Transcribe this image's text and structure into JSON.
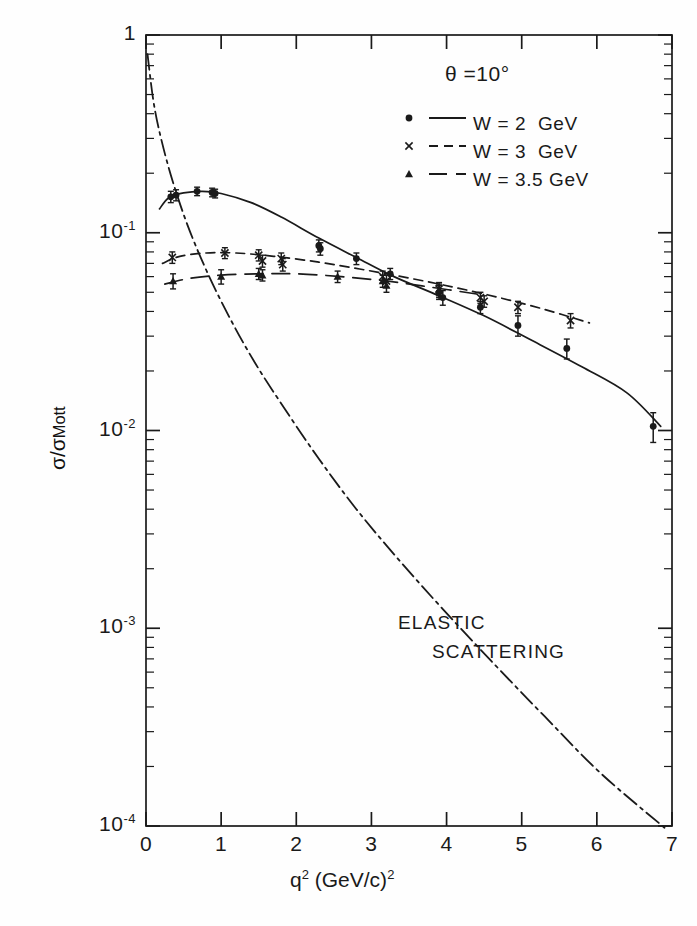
{
  "figure": {
    "annotation_theta": "θ =10°",
    "annotation_elastic_line1": "ELASTIC",
    "annotation_elastic_line2": "SCATTERING"
  },
  "axes": {
    "x": {
      "title_main": "q",
      "title_sup": "2",
      "title_unit": " (GeV/c)",
      "title_unit_sup": "2",
      "title_full": "q2 (GeV/c)2",
      "ticks": [
        "0",
        "1",
        "2",
        "3",
        "4",
        "5",
        "6",
        "7"
      ],
      "range": [
        0,
        7
      ]
    },
    "y": {
      "title_full": "σ/σ",
      "title_sub": "Mott",
      "ticks": [
        {
          "label": "1",
          "exp": "",
          "value": 1
        },
        {
          "label": "10",
          "exp": "-1",
          "value": 0.1
        },
        {
          "label": "10",
          "exp": "-2",
          "value": 0.01
        },
        {
          "label": "10",
          "exp": "-3",
          "value": 0.001
        },
        {
          "label": "10",
          "exp": "-4",
          "value": 0.0001
        }
      ],
      "range": [
        0.0001,
        1
      ],
      "scale": "log"
    }
  },
  "legend": {
    "position": "top-right",
    "entries": [
      {
        "marker": "dot",
        "line": "solid",
        "label": "W = 2  GeV"
      },
      {
        "marker": "cross",
        "line": "dashed",
        "label": "W = 3  GeV"
      },
      {
        "marker": "triangle",
        "line": "longdash",
        "label": "W = 3.5 GeV"
      }
    ]
  },
  "chart_data": {
    "type": "scatter",
    "title": "",
    "subtitle": "",
    "xlabel": "q2 (GeV/c)2",
    "ylabel": "sigma/sigma_Mott",
    "xlim": [
      0,
      7
    ],
    "ylim": [
      0.0001,
      1
    ],
    "yscale": "log",
    "grid": false,
    "legend_position": "top-right",
    "annotations": [
      {
        "text": "θ =10°",
        "x": 3.3,
        "y": 0.52
      },
      {
        "text": "ELASTIC SCATTERING",
        "x": 4.4,
        "y": 0.0014
      }
    ],
    "series": [
      {
        "name": "W = 2  GeV",
        "marker": "dot",
        "linestyle": "solid",
        "points": [
          {
            "x": 0.33,
            "y": 0.152,
            "yerr": 0.01
          },
          {
            "x": 0.4,
            "y": 0.155,
            "yerr": 0.01
          },
          {
            "x": 0.68,
            "y": 0.162,
            "yerr": 0.008
          },
          {
            "x": 0.88,
            "y": 0.16,
            "yerr": 0.008
          },
          {
            "x": 0.92,
            "y": 0.158,
            "yerr": 0.008
          },
          {
            "x": 2.3,
            "y": 0.086,
            "yerr": 0.006
          },
          {
            "x": 2.32,
            "y": 0.083,
            "yerr": 0.006
          },
          {
            "x": 2.8,
            "y": 0.074,
            "yerr": 0.005
          },
          {
            "x": 3.25,
            "y": 0.062,
            "yerr": 0.004
          },
          {
            "x": 3.9,
            "y": 0.05,
            "yerr": 0.004
          },
          {
            "x": 3.95,
            "y": 0.047,
            "yerr": 0.004
          },
          {
            "x": 4.45,
            "y": 0.042,
            "yerr": 0.003
          },
          {
            "x": 4.95,
            "y": 0.034,
            "yerr": 0.004
          },
          {
            "x": 5.6,
            "y": 0.026,
            "yerr": 0.003
          },
          {
            "x": 6.75,
            "y": 0.0105,
            "yerr": 0.0018
          }
        ],
        "curve": [
          {
            "x": 0.18,
            "y": 0.132
          },
          {
            "x": 0.3,
            "y": 0.15
          },
          {
            "x": 0.5,
            "y": 0.159
          },
          {
            "x": 0.75,
            "y": 0.162
          },
          {
            "x": 1.0,
            "y": 0.158
          },
          {
            "x": 1.4,
            "y": 0.142
          },
          {
            "x": 1.8,
            "y": 0.12
          },
          {
            "x": 2.3,
            "y": 0.094
          },
          {
            "x": 2.8,
            "y": 0.075
          },
          {
            "x": 3.3,
            "y": 0.06
          },
          {
            "x": 3.9,
            "y": 0.048
          },
          {
            "x": 4.5,
            "y": 0.038
          },
          {
            "x": 5.1,
            "y": 0.029
          },
          {
            "x": 5.8,
            "y": 0.021
          },
          {
            "x": 6.4,
            "y": 0.0155
          },
          {
            "x": 6.85,
            "y": 0.0105
          }
        ]
      },
      {
        "name": "W = 3  GeV",
        "marker": "cross",
        "linestyle": "dashed",
        "points": [
          {
            "x": 0.35,
            "y": 0.075,
            "yerr": 0.005
          },
          {
            "x": 1.05,
            "y": 0.079,
            "yerr": 0.005
          },
          {
            "x": 1.5,
            "y": 0.077,
            "yerr": 0.005
          },
          {
            "x": 1.55,
            "y": 0.072,
            "yerr": 0.005
          },
          {
            "x": 1.8,
            "y": 0.074,
            "yerr": 0.005
          },
          {
            "x": 1.82,
            "y": 0.069,
            "yerr": 0.005
          },
          {
            "x": 3.15,
            "y": 0.06,
            "yerr": 0.004
          },
          {
            "x": 3.2,
            "y": 0.057,
            "yerr": 0.004
          },
          {
            "x": 3.9,
            "y": 0.052,
            "yerr": 0.004
          },
          {
            "x": 4.45,
            "y": 0.047,
            "yerr": 0.003
          },
          {
            "x": 4.5,
            "y": 0.045,
            "yerr": 0.003
          },
          {
            "x": 4.95,
            "y": 0.042,
            "yerr": 0.003
          },
          {
            "x": 5.65,
            "y": 0.036,
            "yerr": 0.003
          }
        ],
        "curve": [
          {
            "x": 0.22,
            "y": 0.07
          },
          {
            "x": 0.45,
            "y": 0.076
          },
          {
            "x": 0.8,
            "y": 0.079
          },
          {
            "x": 1.2,
            "y": 0.079
          },
          {
            "x": 1.7,
            "y": 0.076
          },
          {
            "x": 2.3,
            "y": 0.071
          },
          {
            "x": 2.9,
            "y": 0.065
          },
          {
            "x": 3.5,
            "y": 0.059
          },
          {
            "x": 4.1,
            "y": 0.053
          },
          {
            "x": 4.7,
            "y": 0.047
          },
          {
            "x": 5.3,
            "y": 0.041
          },
          {
            "x": 5.9,
            "y": 0.035
          }
        ]
      },
      {
        "name": "W = 3.5 GeV",
        "marker": "triangle",
        "linestyle": "longdash",
        "points": [
          {
            "x": 0.36,
            "y": 0.057,
            "yerr": 0.005
          },
          {
            "x": 1.0,
            "y": 0.06,
            "yerr": 0.005
          },
          {
            "x": 1.5,
            "y": 0.062,
            "yerr": 0.004
          },
          {
            "x": 1.55,
            "y": 0.061,
            "yerr": 0.004
          },
          {
            "x": 2.55,
            "y": 0.06,
            "yerr": 0.004
          },
          {
            "x": 3.15,
            "y": 0.057,
            "yerr": 0.004
          },
          {
            "x": 3.2,
            "y": 0.054,
            "yerr": 0.004
          },
          {
            "x": 3.9,
            "y": 0.051,
            "yerr": 0.004
          }
        ],
        "curve": [
          {
            "x": 0.25,
            "y": 0.055
          },
          {
            "x": 0.6,
            "y": 0.059
          },
          {
            "x": 1.0,
            "y": 0.061
          },
          {
            "x": 1.5,
            "y": 0.062
          },
          {
            "x": 2.0,
            "y": 0.062
          },
          {
            "x": 2.6,
            "y": 0.06
          },
          {
            "x": 3.2,
            "y": 0.057
          },
          {
            "x": 3.8,
            "y": 0.053
          },
          {
            "x": 4.4,
            "y": 0.049
          }
        ]
      },
      {
        "name": "ELASTIC SCATTERING",
        "marker": "none",
        "linestyle": "dashdot",
        "points": [],
        "curve": [
          {
            "x": 0.02,
            "y": 0.8
          },
          {
            "x": 0.1,
            "y": 0.46
          },
          {
            "x": 0.2,
            "y": 0.3
          },
          {
            "x": 0.35,
            "y": 0.185
          },
          {
            "x": 0.55,
            "y": 0.11
          },
          {
            "x": 0.8,
            "y": 0.065
          },
          {
            "x": 1.1,
            "y": 0.038
          },
          {
            "x": 1.45,
            "y": 0.022
          },
          {
            "x": 1.85,
            "y": 0.0128
          },
          {
            "x": 2.3,
            "y": 0.0072
          },
          {
            "x": 2.8,
            "y": 0.004
          },
          {
            "x": 3.35,
            "y": 0.00225
          },
          {
            "x": 3.95,
            "y": 0.00125
          },
          {
            "x": 4.6,
            "y": 0.00068
          },
          {
            "x": 5.3,
            "y": 0.00036
          },
          {
            "x": 6.05,
            "y": 0.000185
          },
          {
            "x": 6.9,
            "y": 9.8e-05
          }
        ]
      }
    ]
  },
  "style": {
    "ink": "#1a1a1a",
    "paper": "#fefefe"
  }
}
